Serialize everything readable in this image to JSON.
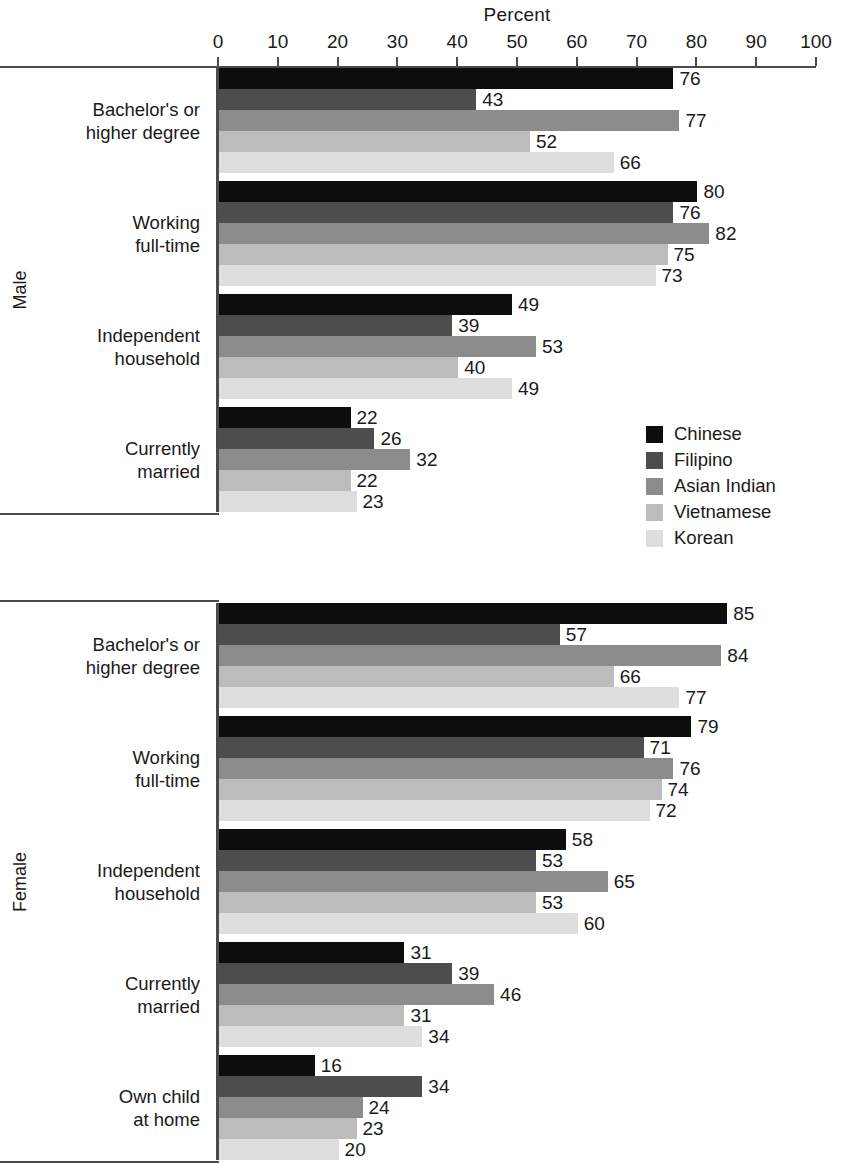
{
  "chart_data": {
    "type": "bar",
    "orientation": "horizontal",
    "title": "",
    "xlabel": "Percent",
    "ylabel": "",
    "xlim": [
      0,
      100
    ],
    "xticks": [
      0,
      10,
      20,
      30,
      40,
      50,
      60,
      70,
      80,
      90,
      100
    ],
    "xtick_labels": [
      "0",
      "10",
      "20",
      "30",
      "40",
      "50",
      "60",
      "70",
      "80",
      "90",
      "100"
    ],
    "grid": false,
    "legend_position": "middle-right",
    "legend": [
      "Chinese",
      "Filipino",
      "Asian Indian",
      "Vietnamese",
      "Korean"
    ],
    "series_colors": [
      "#0d0d0d",
      "#4d4d4d",
      "#8c8c8c",
      "#bcbcbc",
      "#dedede"
    ],
    "panels": [
      {
        "name": "Male",
        "groups": [
          {
            "category": "Bachelor's or higher degree",
            "label_lines": [
              "Bachelor's or",
              "higher degree"
            ],
            "values": [
              76,
              43,
              77,
              52,
              66
            ]
          },
          {
            "category": "Working full-time",
            "label_lines": [
              "Working",
              "full-time"
            ],
            "values": [
              80,
              76,
              82,
              75,
              73
            ]
          },
          {
            "category": "Independent household",
            "label_lines": [
              "Independent",
              "household"
            ],
            "values": [
              49,
              39,
              53,
              40,
              49
            ]
          },
          {
            "category": "Currently married",
            "label_lines": [
              "Currently",
              "married"
            ],
            "values": [
              22,
              26,
              32,
              22,
              23
            ]
          }
        ]
      },
      {
        "name": "Female",
        "groups": [
          {
            "category": "Bachelor's or higher degree",
            "label_lines": [
              "Bachelor's or",
              "higher degree"
            ],
            "values": [
              85,
              57,
              84,
              66,
              77
            ]
          },
          {
            "category": "Working full-time",
            "label_lines": [
              "Working",
              "full-time"
            ],
            "values": [
              79,
              71,
              76,
              74,
              72
            ]
          },
          {
            "category": "Independent household",
            "label_lines": [
              "Independent",
              "household"
            ],
            "values": [
              58,
              53,
              65,
              53,
              60
            ]
          },
          {
            "category": "Currently married",
            "label_lines": [
              "Currently",
              "married"
            ],
            "values": [
              31,
              39,
              46,
              31,
              34
            ]
          },
          {
            "category": "Own child at home",
            "label_lines": [
              "Own child",
              "at home"
            ],
            "values": [
              16,
              34,
              24,
              23,
              20
            ]
          }
        ]
      }
    ]
  },
  "axis": {
    "title": "Percent"
  },
  "legend": {
    "items": [
      {
        "label": "Chinese",
        "color": "#0d0d0d"
      },
      {
        "label": "Filipino",
        "color": "#4d4d4d"
      },
      {
        "label": "Asian Indian",
        "color": "#8c8c8c"
      },
      {
        "label": "Vietnamese",
        "color": "#bcbcbc"
      },
      {
        "label": "Korean",
        "color": "#dedede"
      }
    ]
  },
  "panels": [
    {
      "label": "Male"
    },
    {
      "label": "Female"
    }
  ]
}
